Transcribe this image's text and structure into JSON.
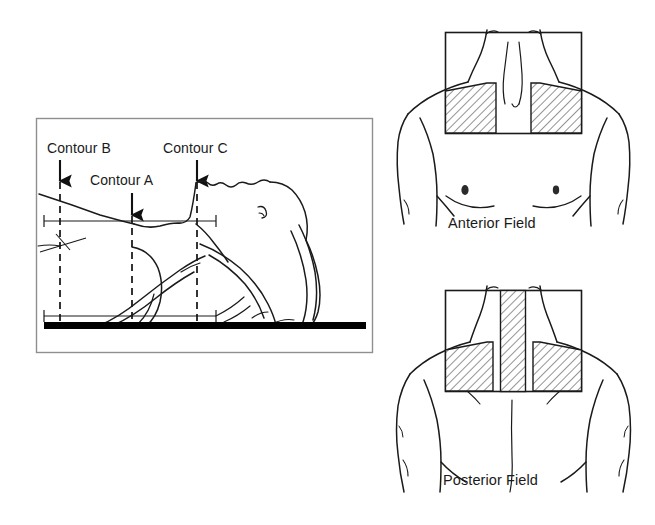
{
  "figure": {
    "background_color": "#ffffff",
    "line_color": "#1a1a1a",
    "hatch_color": "#333333"
  },
  "sagittal_panel": {
    "name": "lateral contour panel",
    "border_color": "#8a8a8a",
    "table_color": "#000000",
    "labels": {
      "contour_b": "Contour B",
      "contour_a": "Contour A",
      "contour_c": "Contour C"
    },
    "arrows": [
      {
        "label": "Contour B",
        "x": 60,
        "tip_y": 182
      },
      {
        "label": "Contour A",
        "x": 132,
        "tip_y": 216
      },
      {
        "label": "Contour C",
        "x": 197,
        "tip_y": 182
      }
    ],
    "dashed_lines": [
      {
        "label": "Contour B",
        "x": 60
      },
      {
        "label": "Contour A",
        "x": 132
      },
      {
        "label": "Contour C",
        "x": 197
      }
    ]
  },
  "anterior_panel": {
    "label": "Anterior Field",
    "field_block_count": 2,
    "blocks": [
      "left lung apex block",
      "right lung apex block"
    ]
  },
  "posterior_panel": {
    "label": "Posterior Field",
    "field_block_count": 3,
    "blocks": [
      "spinal cord midline block",
      "left lung apex block",
      "right lung apex block"
    ]
  }
}
